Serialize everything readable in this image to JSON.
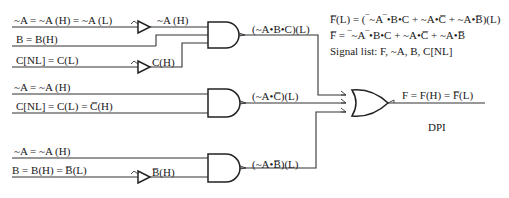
{
  "diagram": {
    "type": "logic-circuit",
    "equations": {
      "line1": "F̅(L) = (‾~A‾•B•C + ~A•C̅ + ~A•B̅)(L)",
      "line2": "F̅ = ‾~A‾•B•C + ~A•C̅ + ~A•B̅",
      "signal_list": "Signal list:  F, ~A, B, C[NL]"
    },
    "gate1": {
      "inputs": [
        {
          "label": "~A = ~A (H) = ~A (L)",
          "after_inverter": "~A (H)"
        },
        {
          "label": "B = B(H)"
        },
        {
          "label": "C[NL] = C(L)",
          "after_inverter": "C(H)"
        }
      ],
      "output": "(~A•B•C)(L)"
    },
    "gate2": {
      "inputs": [
        {
          "label": "~A = ~A (H)"
        },
        {
          "label": "C[NL] = C(L) = C̅(H)"
        }
      ],
      "output": "(~A•C̅)(L)"
    },
    "gate3": {
      "inputs": [
        {
          "label": "~A = ~A (H)"
        },
        {
          "label": "B = B(H) = B̅(L)",
          "after_inverter": "B̅(H)"
        }
      ],
      "output": "(~A•B̅)(L)"
    },
    "or_gate": {
      "output": "F = F(H) = F̅(L)"
    },
    "caption": "DPI"
  }
}
